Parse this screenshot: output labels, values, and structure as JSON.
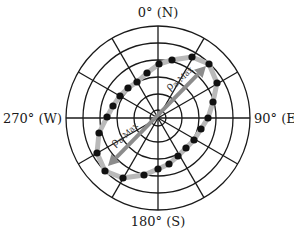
{
  "diagram": {
    "type": "polar-resistivity-plot",
    "center": [
      158,
      118
    ],
    "ring_radii": [
      8,
      24,
      41,
      58,
      75,
      92
    ],
    "spoke_angles_deg": [
      0,
      30,
      60,
      90,
      120,
      150,
      180,
      210,
      240,
      270,
      300,
      330
    ],
    "colors": {
      "grid": "#1a1a1a",
      "ellipse": "#b9b9b9",
      "arrow": "#8c8c8c",
      "dots": "#111111"
    },
    "labels": {
      "north": "0° (N)",
      "east": "90° (E)",
      "south": "180° (S)",
      "west": "270° (W)"
    },
    "arrow_label": {
      "symbol": "ρ",
      "subscript": "a-Max"
    },
    "arrow": {
      "ne_tip": [
        206,
        66
      ],
      "sw_tip": [
        108,
        166
      ]
    },
    "data_points": [
      [
        172,
        60
      ],
      [
        192,
        57
      ],
      [
        209,
        64
      ],
      [
        217,
        83
      ],
      [
        213,
        102
      ],
      [
        208,
        118
      ],
      [
        201,
        129
      ],
      [
        194,
        140
      ],
      [
        186,
        148
      ],
      [
        178,
        156
      ],
      [
        169,
        164
      ],
      [
        158,
        169
      ],
      [
        144,
        175
      ],
      [
        123,
        178
      ],
      [
        105,
        171
      ],
      [
        97,
        153
      ],
      [
        99,
        133
      ],
      [
        107,
        117
      ],
      [
        113,
        106
      ],
      [
        120,
        96
      ],
      [
        128,
        88
      ],
      [
        137,
        82
      ],
      [
        147,
        73
      ],
      [
        159,
        64
      ]
    ]
  }
}
